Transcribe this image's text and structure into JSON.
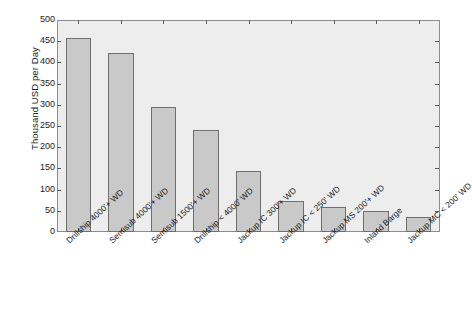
{
  "chart_data": {
    "type": "bar",
    "title": "",
    "xlabel": "",
    "ylabel": "Thousand USD per Day",
    "ylim": [
      0,
      500
    ],
    "yticks": [
      0,
      50,
      100,
      150,
      200,
      250,
      300,
      350,
      400,
      450,
      500
    ],
    "grid": false,
    "legend": null,
    "categories": [
      "Drillship 4000'+ WD",
      "Semisub 4000'+ WD",
      "Semisub 1500'+ WD",
      "Drillship < 4000' WD",
      "Jackup IC 300'+ WD",
      "Jackup IC < 250' WD",
      "Jackup MS 200'+ WD",
      "Inland Barge",
      "Jackup MC < 200' WD"
    ],
    "values": [
      458,
      422,
      296,
      241,
      143,
      72,
      60,
      49,
      36
    ],
    "bar_color": "#c9c9c9",
    "bar_edge_color": "#6f6f6f",
    "plot_background": "#ededed",
    "axis_color": "#8d8d8d"
  }
}
